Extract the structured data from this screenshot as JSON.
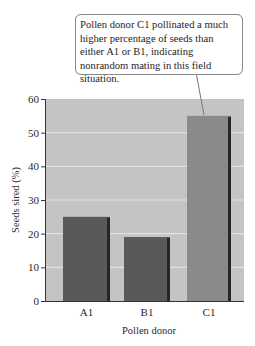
{
  "chart_data": {
    "type": "bar",
    "title": "",
    "categories": [
      "A1",
      "B1",
      "C1"
    ],
    "values": [
      25,
      19,
      55
    ],
    "xlabel": "Pollen donor",
    "ylabel": "Seeds sired (%)",
    "ylim": [
      0,
      60
    ],
    "yticks": [
      0,
      10,
      20,
      30,
      40,
      50,
      60
    ],
    "grid": true,
    "legend": null,
    "annotations": [
      {
        "target": "C1",
        "text": "Pollen donor C1 pollinated a much higher percentage of seeds than either A1 or B1, indicating nonrandom mating in this field situation."
      }
    ],
    "colors": {
      "plot_background": "#c4c4c4",
      "gridline": "#e2e2e2",
      "bar_dark": "#595959",
      "bar_light": "#8a8a8a",
      "bar_shadow": "#262626"
    }
  },
  "callout": {
    "text": "Pollen donor C1 pollinated a much higher percentage of seeds than either A1 or B1, indicating nonrandom mating in this field situation."
  }
}
